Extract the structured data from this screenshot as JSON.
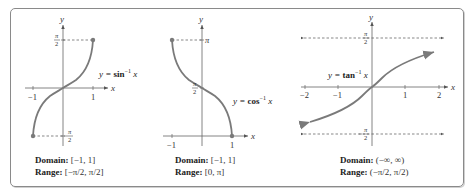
{
  "colors": {
    "curve": "#7a7a7a",
    "axis": "#666666",
    "dash": "#555555",
    "frame": "#8a8a8a",
    "text": "#222222"
  },
  "panels": [
    {
      "name": "arcsin",
      "label": "y = sin⁻¹ x",
      "label_parts": {
        "lhs": "y = ",
        "fn": "sin",
        "exp": "−1",
        "var": " x"
      },
      "axis_x": "x",
      "axis_y": "y",
      "x_ticks": [
        "−1",
        "1"
      ],
      "y_ticks": [
        "π/2",
        "−π/2"
      ],
      "domain_label": "Domain:",
      "domain_value": "[−1, 1]",
      "range_label": "Range:",
      "range_value": "[−π/2, π/2]"
    },
    {
      "name": "arccos",
      "label": "y = cos⁻¹ x",
      "label_parts": {
        "lhs": "y = ",
        "fn": "cos",
        "exp": "−1",
        "var": " x"
      },
      "axis_x": "x",
      "axis_y": "y",
      "x_ticks": [
        "−1",
        "1"
      ],
      "y_ticks": [
        "π",
        "π/2"
      ],
      "domain_label": "Domain:",
      "domain_value": "[−1, 1]",
      "range_label": "Range:",
      "range_value": "[0, π]"
    },
    {
      "name": "arctan",
      "label": "y = tan⁻¹ x",
      "label_parts": {
        "lhs": "y = ",
        "fn": "tan",
        "exp": "−1",
        "var": " x"
      },
      "axis_x": "x",
      "axis_y": "y",
      "x_ticks": [
        "−2",
        "−1",
        "1",
        "2"
      ],
      "y_ticks": [
        "π/2",
        "−π/2"
      ],
      "domain_label": "Domain:",
      "domain_value": "(−∞, ∞)",
      "range_label": "Range:",
      "range_value": "(−π/2, π/2)"
    }
  ]
}
